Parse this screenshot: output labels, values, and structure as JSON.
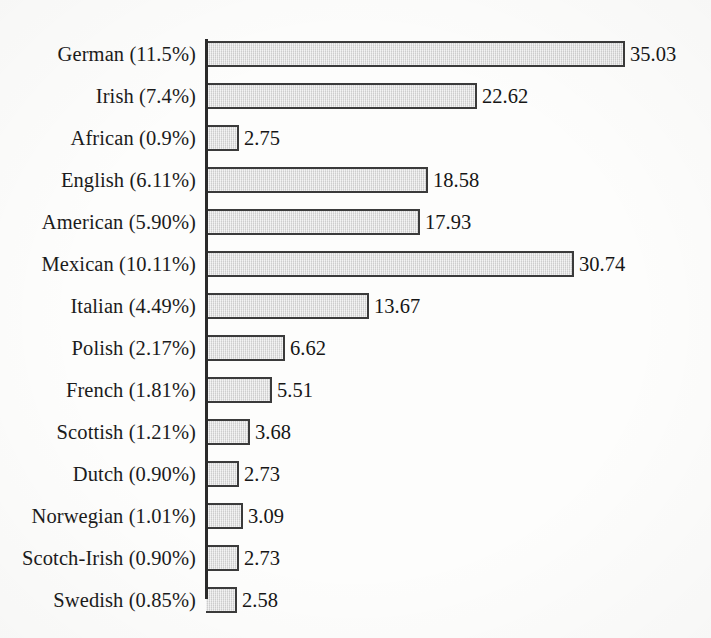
{
  "chart_data": {
    "type": "bar",
    "orientation": "horizontal",
    "title": "",
    "subtitle": "",
    "xlabel": "",
    "ylabel": "",
    "grid": false,
    "legend": null,
    "axis_visible": {
      "category_axis": true,
      "value_axis": false,
      "value_ticks": false
    },
    "xlim": [
      0,
      35.03
    ],
    "value_label_format": "two-decimal",
    "categories": [
      "German (11.5%)",
      "Irish (7.4%)",
      "African (0.9%)",
      "English (6.11%)",
      "American (5.90%)",
      "Mexican (10.11%)",
      "Italian (4.49%)",
      "Polish (2.17%)",
      "French (1.81%)",
      "Scottish (1.21%)",
      "Dutch (0.90%)",
      "Norwegian (1.01%)",
      "Scotch-Irish (0.90%)",
      "Swedish (0.85%)"
    ],
    "values": [
      35.03,
      22.62,
      2.75,
      18.58,
      17.93,
      30.74,
      13.67,
      6.62,
      5.51,
      3.68,
      2.73,
      3.09,
      2.73,
      2.58
    ],
    "value_labels": [
      "35.03",
      "22.62",
      "2.75",
      "18.58",
      "17.93",
      "30.74",
      "13.67",
      "6.62",
      "5.51",
      "3.68",
      "2.73",
      "3.09",
      "2.73",
      "2.58"
    ],
    "group_names": [
      "German",
      "Irish",
      "African",
      "English",
      "American",
      "Mexican",
      "Italian",
      "Polish",
      "French",
      "Scottish",
      "Dutch",
      "Norwegian",
      "Scotch-Irish",
      "Swedish"
    ],
    "group_percents": [
      "11.5%",
      "7.4%",
      "0.9%",
      "6.11%",
      "5.90%",
      "10.11%",
      "4.49%",
      "2.17%",
      "1.81%",
      "1.21%",
      "0.90%",
      "1.01%",
      "0.90%",
      "0.85%"
    ],
    "rows": [
      {
        "label": "German (11.5%)",
        "name": "German",
        "percent": "11.5%",
        "value": 35.03,
        "value_label": "35.03",
        "ghost": ""
      },
      {
        "label": "Irish (7.4%)",
        "name": "Irish",
        "percent": "7.4%",
        "value": 22.62,
        "value_label": "22.62",
        "ghost": ""
      },
      {
        "label": "African (0.9%)",
        "name": "African",
        "percent": "0.9%",
        "value": 2.75,
        "value_label": "2.75",
        "ghost": ""
      },
      {
        "label": "English (6.11%)",
        "name": "English",
        "percent": "6.11%",
        "value": 18.58,
        "value_label": "18.58",
        "ghost": ""
      },
      {
        "label": "American (5.90%)",
        "name": "American",
        "percent": "5.90%",
        "value": 17.93,
        "value_label": "17.93",
        "ghost": ""
      },
      {
        "label": "Mexican (10.11%)",
        "name": "Mexican",
        "percent": "10.11%",
        "value": 30.74,
        "value_label": "30.74",
        "ghost": ""
      },
      {
        "label": "Italian (4.49%)",
        "name": "Italian",
        "percent": "4.49%",
        "value": 13.67,
        "value_label": "13.67",
        "ghost": ""
      },
      {
        "label": "Polish (2.17%)",
        "name": "Polish",
        "percent": "2.17%",
        "value": 6.62,
        "value_label": "6.62",
        "ghost": ""
      },
      {
        "label": "French (1.81%)",
        "name": "French",
        "percent": "1.81%",
        "value": 5.51,
        "value_label": "5.51",
        "ghost": ""
      },
      {
        "label": "Scottish (1.21%)",
        "name": "Scottish",
        "percent": "1.21%",
        "value": 3.68,
        "value_label": "3.68",
        "ghost": ""
      },
      {
        "label": "Dutch (0.90%)",
        "name": "Dutch",
        "percent": "0.90%",
        "value": 2.73,
        "value_label": "2.73",
        "ghost": ""
      },
      {
        "label": "Norwegian (1.01%)",
        "name": "Norwegian",
        "percent": "1.01%",
        "value": 3.09,
        "value_label": "3.09",
        "ghost": ""
      },
      {
        "label": "Scotch-Irish (0.90%)",
        "name": "Scotch-Irish",
        "percent": "0.90%",
        "value": 2.73,
        "value_label": "2.73",
        "ghost": ""
      },
      {
        "label": "Swedish (0.85%)",
        "name": "Swedish",
        "percent": "0.85%",
        "value": 2.58,
        "value_label": "2.58",
        "ghost": ""
      }
    ],
    "colors": {
      "bar_fill": "#d9d9d9",
      "bar_border": "#3b3b3b",
      "axis": "#2a2a2a",
      "text": "#1b1b1b",
      "background": "#fdfdfc"
    }
  },
  "geometry": {
    "axis_x": 206,
    "first_bar_top": 41,
    "bar_height": 26,
    "row_pitch": 42,
    "px_per_unit": 11.96
  }
}
